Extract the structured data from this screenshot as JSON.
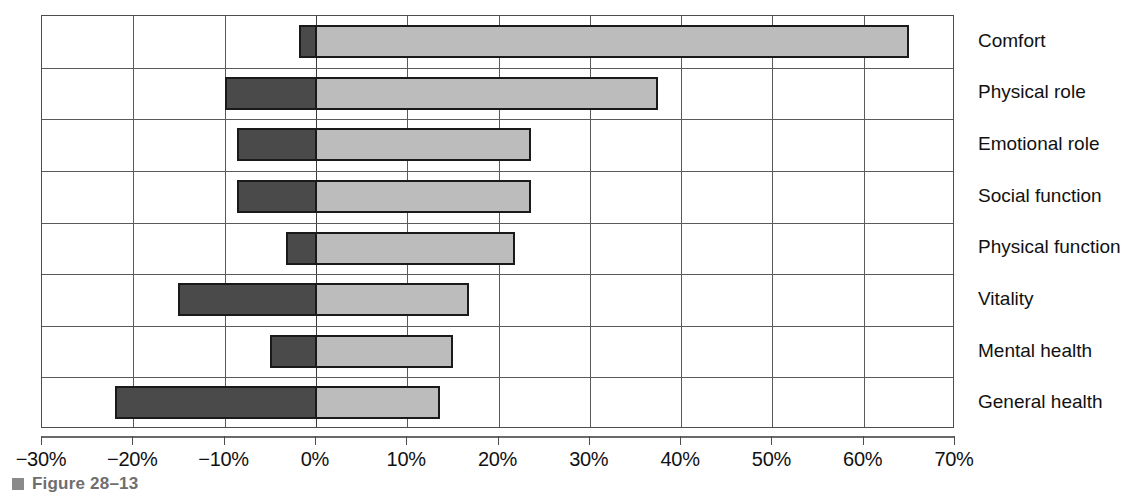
{
  "caption": {
    "bullet_icon": "square-bullet-icon",
    "text": "Figure 28–13"
  },
  "chart_data": {
    "type": "bar",
    "orientation": "horizontal",
    "title": "",
    "subtitle": "",
    "xlabel": "",
    "ylabel": "",
    "xlim": [
      -30,
      70
    ],
    "xticks": [
      -30,
      -20,
      -10,
      0,
      10,
      20,
      30,
      40,
      50,
      60,
      70
    ],
    "xtick_labels": [
      "−30%",
      "−20%",
      "−10%",
      "0%",
      "10%",
      "20%",
      "30%",
      "40%",
      "50%",
      "60%",
      "70%"
    ],
    "grid": true,
    "legend": [],
    "categories": [
      "Comfort",
      "Physical role",
      "Emotional role",
      "Social function",
      "Physical function",
      "Vitality",
      "Mental health",
      "General health"
    ],
    "series": [
      {
        "name": "negative",
        "color": "#4a4a4a",
        "values": [
          -1.8,
          -10.0,
          -8.6,
          -8.6,
          -3.3,
          -15.1,
          -5.0,
          -22.0
        ]
      },
      {
        "name": "positive",
        "color": "#bcbcbc",
        "values": [
          65.0,
          37.5,
          23.6,
          23.6,
          21.8,
          16.8,
          15.0,
          13.6
        ]
      }
    ]
  }
}
